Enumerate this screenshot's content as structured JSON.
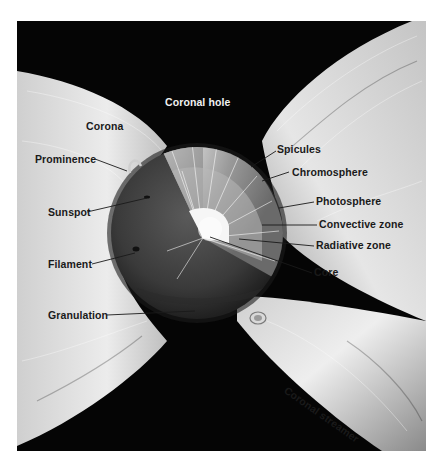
{
  "diagram": {
    "colors": {
      "space": "#050505",
      "corona_light": "#ececec",
      "corona_mid": "#bdbdbd",
      "sun_surface": "#3a3a3a",
      "interior": "#8a8a8a",
      "core": "#f4f4f4",
      "label_dark": "#1a1a1a",
      "label_light": "#f2f2f2"
    },
    "labels": {
      "coronal_hole": "Coronal hole",
      "corona": "Corona",
      "prominence": "Prominence",
      "sunspot": "Sunspot",
      "filament": "Filament",
      "granulation": "Granulation",
      "spicules": "Spicules",
      "chromosphere": "Chromosphere",
      "photosphere": "Photosphere",
      "convective_zone": "Convective zone",
      "radiative_zone": "Radiative zone",
      "core": "Core",
      "coronal_streamer": "Coronal streamer"
    }
  }
}
